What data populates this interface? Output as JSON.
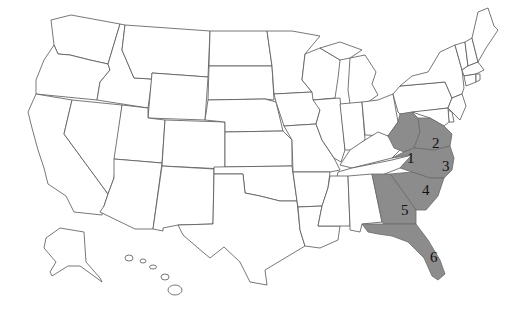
{
  "map": {
    "title": "United States map with shaded southeastern regions",
    "colors": {
      "background": "#ffffff",
      "state_fill": "#ffffff",
      "state_stroke": "#555555",
      "shaded_fill": "#8c8c8c",
      "label_color": "#111111"
    },
    "regions": [
      {
        "id": 1,
        "label": "1",
        "x": 412,
        "y": 158
      },
      {
        "id": 2,
        "label": "2",
        "x": 436,
        "y": 144
      },
      {
        "id": 3,
        "label": "3",
        "x": 446,
        "y": 166
      },
      {
        "id": 4,
        "label": "4",
        "x": 426,
        "y": 190
      },
      {
        "id": 5,
        "label": "5",
        "x": 405,
        "y": 210
      },
      {
        "id": 6,
        "label": "6",
        "x": 434,
        "y": 257
      }
    ]
  }
}
